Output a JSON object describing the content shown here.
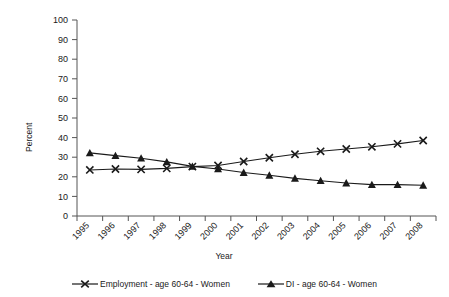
{
  "chart_data": {
    "type": "line",
    "title": "",
    "xlabel": "Year",
    "ylabel": "Percent",
    "categories": [
      "1995",
      "1996",
      "1997",
      "1998",
      "1999",
      "2000",
      "2001",
      "2002",
      "2003",
      "2004",
      "2005",
      "2006",
      "2007",
      "2008"
    ],
    "x_tick_labels": [
      "1995",
      "1996",
      "1997",
      "1998",
      "1999",
      "2000",
      "2001",
      "2002",
      "2003",
      "2004",
      "2005",
      "2006",
      "2007",
      "2008"
    ],
    "y_tick_labels": [
      "0",
      "10",
      "20",
      "30",
      "40",
      "50",
      "60",
      "70",
      "80",
      "90",
      "100"
    ],
    "y_ticks": [
      0,
      10,
      20,
      30,
      40,
      50,
      60,
      70,
      80,
      90,
      100
    ],
    "ylim": [
      0,
      100
    ],
    "grid": false,
    "legend_position": "bottom",
    "series": [
      {
        "name": "Employment - age 60-64 - Women",
        "marker": "x",
        "color": "#1a1a1a",
        "values": [
          23.5,
          24.0,
          23.8,
          24.3,
          25.2,
          25.8,
          27.8,
          29.7,
          31.5,
          33.0,
          34.2,
          35.3,
          36.8,
          38.5
        ]
      },
      {
        "name": "DI - age 60-64 - Women",
        "marker": "triangle",
        "color": "#1a1a1a",
        "values": [
          32.2,
          30.8,
          29.5,
          27.6,
          25.3,
          24.0,
          22.2,
          20.8,
          19.2,
          18.0,
          16.8,
          16.0,
          16.0,
          15.7
        ]
      }
    ]
  },
  "legend": {
    "entries": [
      {
        "label": "Employment - age 60-64 - Women",
        "marker": "x-marker-icon"
      },
      {
        "label": "DI - age 60-64 - Women",
        "marker": "triangle-marker-icon"
      }
    ]
  },
  "axes": {
    "x_title": "Year",
    "y_title": "Percent"
  }
}
